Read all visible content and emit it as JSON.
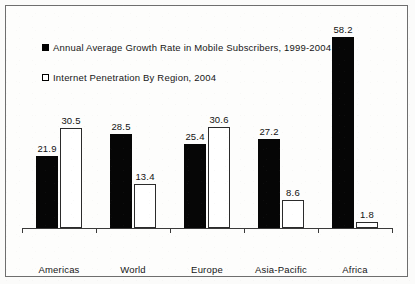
{
  "chart_data": {
    "type": "bar",
    "title": "",
    "subtitle": "",
    "xlabel": "",
    "ylabel": "",
    "ylim": [
      0,
      62
    ],
    "grid": false,
    "legend_position": "top-left",
    "categories": [
      "Americas",
      "World",
      "Europe",
      "Asia-Pacific",
      "Africa"
    ],
    "series": [
      {
        "name": "Annual Average Growth Rate in Mobile Subscribers, 1999-2004",
        "marker": "filled-square",
        "color": "#000000",
        "values": [
          21.9,
          28.5,
          25.4,
          27.2,
          58.2
        ],
        "labels": [
          "21.9",
          "28.5",
          "25.4",
          "27.2",
          "58.2"
        ]
      },
      {
        "name": "Internet Penetration By Region, 2004",
        "marker": "hollow-square",
        "color": "#ffffff",
        "values": [
          30.5,
          13.4,
          30.6,
          8.6,
          1.8
        ],
        "labels": [
          "30.5",
          "13.4",
          "30.6",
          "8.6",
          "1.8"
        ]
      }
    ]
  },
  "legend": {
    "items": [
      {
        "label": "Annual Average Growth Rate in Mobile Subscribers, 1999-2004",
        "marker": "filled-square"
      },
      {
        "label": "Internet Penetration By Region, 2004",
        "marker": "hollow-square"
      }
    ]
  },
  "axis": {
    "categories": [
      "Americas",
      "World",
      "Europe",
      "Asia-Pacific",
      "Africa"
    ]
  },
  "colors": {
    "series_1": "#000000",
    "series_2": "#ffffff",
    "axis": "#3a3a3a",
    "border": "#6e6e6e",
    "background": "#fdfdfc",
    "text": "#161616"
  }
}
